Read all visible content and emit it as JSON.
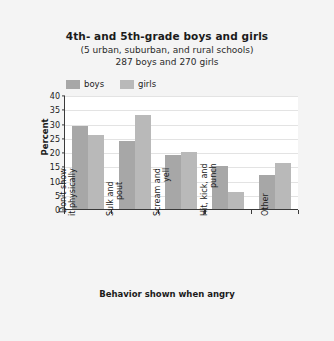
{
  "chart_data": {
    "type": "bar",
    "title": "4th- and 5th-grade boys and girls",
    "subtitle": "(5 urban, suburban, and rural schools)",
    "subtitle2": "287 boys and 270 girls",
    "xlabel": "Behavior shown when angry",
    "ylabel": "Percent",
    "ylim": [
      0,
      40
    ],
    "yticks": [
      40,
      35,
      30,
      25,
      20,
      15,
      10,
      5,
      0
    ],
    "grid": true,
    "legend_position": "top-left",
    "categories": [
      "Don't show\nit physically",
      "Sulk and\npout",
      "Scream and\nyell",
      "Hit, kick, and\npunch",
      "Other"
    ],
    "series": [
      {
        "name": "boys",
        "color": "#a7a7a7",
        "values": [
          29,
          24,
          19,
          15,
          12
        ]
      },
      {
        "name": "girls",
        "color": "#b9b9b9",
        "values": [
          26,
          33,
          20,
          6,
          16
        ]
      }
    ]
  },
  "legend": {
    "items": [
      {
        "label": "boys",
        "color": "#a7a7a7"
      },
      {
        "label": "girls",
        "color": "#b9b9b9"
      }
    ]
  },
  "ytick_labels": [
    "40",
    "35",
    "30",
    "25",
    "20",
    "15",
    "10",
    "5",
    "0"
  ],
  "category_labels": [
    {
      "line1": "Don't show",
      "line2": "it physically"
    },
    {
      "line1": "Sulk and",
      "line2": "pout"
    },
    {
      "line1": "Scream and",
      "line2": "yell"
    },
    {
      "line1": "Hit, kick, and",
      "line2": "punch"
    },
    {
      "line1": "Other",
      "line2": ""
    }
  ],
  "colors": {
    "background": "#f4f4f4",
    "plot_background": "#ffffff",
    "axis": "#3a3a3a",
    "gridline": "#e3e3e3",
    "boys": "#a7a7a7",
    "girls": "#b9b9b9",
    "text": "#1b1b1b"
  }
}
